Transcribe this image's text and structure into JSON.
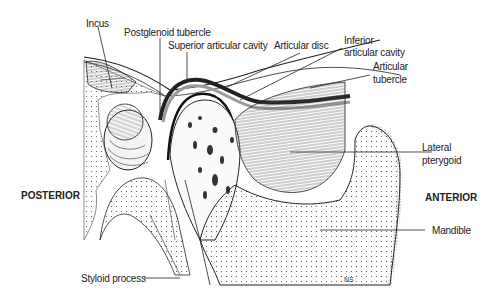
{
  "diagram": {
    "orientation": {
      "left": "POSTERIOR",
      "right": "ANTERIOR"
    },
    "labels": {
      "incus": "Incus",
      "postglenoid_tubercle": "Postglenoid tubercle",
      "superior_articular_cavity": "Superior articular cavity",
      "articular_disc": "Articular disc",
      "inferior_articular_cavity_1": "Inferior",
      "inferior_articular_cavity_2": "articular cavity",
      "articular_tubercle_1": "Articular",
      "articular_tubercle_2": "tubercle",
      "lateral_pterygoid_1": "Lateral",
      "lateral_pterygoid_2": "pterygoid",
      "mandible": "Mandible",
      "styloid_process": "Styloid process"
    },
    "signature": "NS"
  }
}
